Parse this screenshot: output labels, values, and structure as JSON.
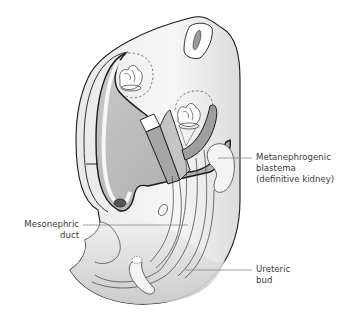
{
  "figure": {
    "colors": {
      "outline": "#1a1a1a",
      "body_fill": "#f2f2f2",
      "shadow_fill": "#d6d6d6",
      "cavity_fill": "#bdbdbd",
      "dark_fill": "#8f8f8f",
      "leader": "#7a7a7a",
      "label_text": "#3a3a3a"
    }
  },
  "labels": {
    "metanephrogenic": {
      "line1": "Metanephrogenic",
      "line2": "blastema",
      "line3": "(definitive kidney)"
    },
    "mesonephric": {
      "line1": "Mesonephric",
      "line2": "duct"
    },
    "ureteric": {
      "line1": "Ureteric",
      "line2": "bud"
    }
  }
}
